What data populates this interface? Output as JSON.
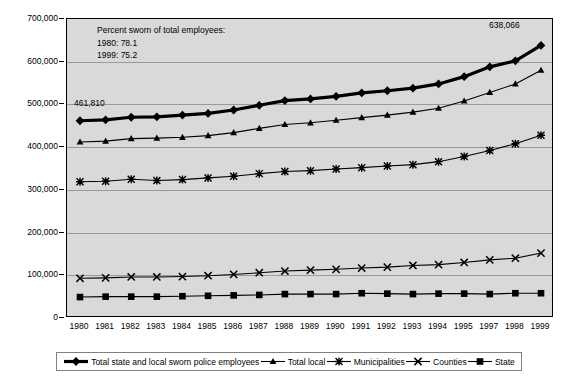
{
  "chart_data": {
    "type": "line",
    "title": "",
    "xlabel": "",
    "ylabel": "",
    "ylim": [
      0,
      700000
    ],
    "grid": true,
    "legend_position": "bottom",
    "x": [
      1980,
      1981,
      1982,
      1983,
      1984,
      1985,
      1986,
      1987,
      1988,
      1989,
      1990,
      1991,
      1992,
      1993,
      1994,
      1995,
      1997,
      1998,
      1999
    ],
    "xtick_labels": [
      "1980",
      "1981",
      "1982",
      "1983",
      "1984",
      "1985",
      "1986",
      "1987",
      "1988",
      "1989",
      "1990",
      "1991",
      "1992",
      "1993",
      "1994",
      "1995",
      "1997",
      "1998",
      "1999"
    ],
    "ytick_labels": [
      "0",
      "100,000",
      "200,000",
      "300,000",
      "400,000",
      "500,000",
      "600,000",
      "700,000"
    ],
    "ytick_values": [
      0,
      100000,
      200000,
      300000,
      400000,
      500000,
      600000,
      700000
    ],
    "series": [
      {
        "name": "Total state and local sworn police employees",
        "marker": "diamond",
        "line_width": "thick",
        "values": [
          461810,
          464000,
          470000,
          471000,
          475000,
          479000,
          487000,
          498000,
          509000,
          513000,
          519000,
          527000,
          532000,
          538000,
          548000,
          565000,
          588000,
          602000,
          638066
        ]
      },
      {
        "name": "Total local",
        "marker": "triangle",
        "line_width": "thin",
        "values": [
          412000,
          414000,
          420000,
          421000,
          423000,
          427000,
          434000,
          444000,
          453000,
          457000,
          463000,
          469000,
          475000,
          482000,
          491000,
          508000,
          528000,
          548000,
          580000
        ]
      },
      {
        "name": "Municipalities",
        "marker": "asterisk",
        "line_width": "thin",
        "values": [
          319000,
          320000,
          325000,
          322000,
          324000,
          328000,
          332000,
          338000,
          343000,
          345000,
          349000,
          352000,
          356000,
          359000,
          366000,
          378000,
          392000,
          408000,
          428000
        ]
      },
      {
        "name": "Counties",
        "marker": "cross",
        "line_width": "thin",
        "values": [
          93000,
          94000,
          96000,
          96000,
          97000,
          99000,
          102000,
          106000,
          110000,
          112000,
          114000,
          117000,
          119000,
          123000,
          125000,
          130000,
          136000,
          140000,
          152000
        ]
      },
      {
        "name": "State",
        "marker": "square",
        "line_width": "thin",
        "values": [
          49000,
          50000,
          50000,
          50000,
          51000,
          52000,
          53000,
          54000,
          56000,
          56000,
          56000,
          58000,
          57000,
          56000,
          57000,
          57000,
          56000,
          58000,
          58000
        ]
      }
    ],
    "annotations": [
      {
        "id": "note",
        "lines": [
          "Percent sworn of total employees:",
          "1980: 78.1",
          "1999: 75.2"
        ]
      },
      {
        "id": "first-point-label",
        "text": "461,810"
      },
      {
        "id": "last-point-label",
        "text": "638,066"
      }
    ],
    "colors": {
      "plot_background": "#d9d9d9",
      "gridline": "#9a9a9a",
      "series": "#000000",
      "axis": "#000000",
      "page_background": "#ffffff"
    }
  }
}
